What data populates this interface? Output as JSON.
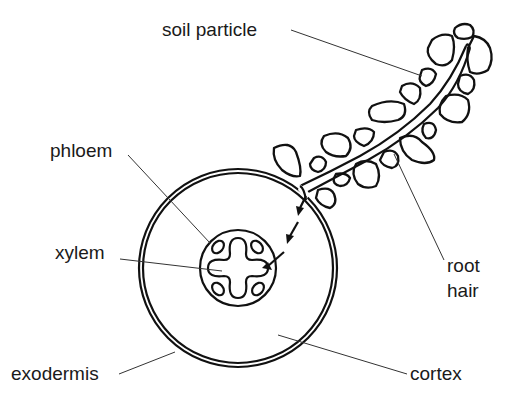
{
  "diagram": {
    "labels": {
      "soil_particle": "soil particle",
      "phloem": "phloem",
      "xylem": "xylem",
      "exodermis": "exodermis",
      "cortex": "cortex",
      "root": "root",
      "hair": "hair"
    },
    "colors": {
      "ink": "#111111",
      "background": "#ffffff"
    }
  }
}
